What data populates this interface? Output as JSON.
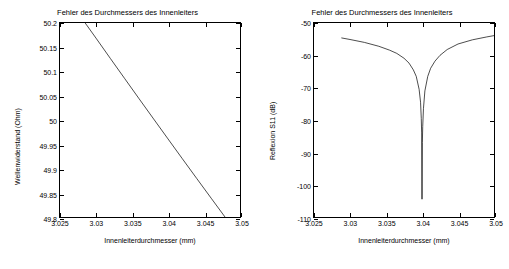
{
  "chart_data": [
    {
      "id": "left",
      "type": "line",
      "title": "Fehler des Durchmessers des Innenleiters",
      "xlabel": "Innenleiterdurchmesser   (mm)",
      "ylabel": "Wellenwiderstand   (Ohm)",
      "xlim": [
        3.025,
        3.05
      ],
      "ylim": [
        49.8,
        50.2
      ],
      "xticks": [
        "3.025",
        "3.03",
        "3.035",
        "3.04",
        "3.045",
        "3.05"
      ],
      "xtick_values": [
        3.025,
        3.03,
        3.035,
        3.04,
        3.045,
        3.05
      ],
      "yticks": [
        "49.8",
        "49.85",
        "49.9",
        "49.95",
        "50",
        "50.05",
        "50.1",
        "50.15",
        "50.2"
      ],
      "ytick_values": [
        49.8,
        49.85,
        49.9,
        49.95,
        50,
        50.05,
        50.1,
        50.15,
        50.2
      ],
      "grid": false,
      "legend": "none",
      "series": [
        {
          "name": "Wellenwiderstand",
          "x": [
            3.0285,
            3.03,
            3.032,
            3.034,
            3.036,
            3.038,
            3.04,
            3.042,
            3.044,
            3.046,
            3.048,
            3.05
          ],
          "y": [
            50.2,
            50.1688,
            50.1268,
            50.0851,
            50.0435,
            50.0022,
            49.961,
            49.92,
            49.8792,
            49.8387,
            49.7983,
            49.7811
          ]
        }
      ]
    },
    {
      "id": "right",
      "type": "line",
      "title": "Fehler des Durchmessers des Innenleiters",
      "xlabel": "Innenleiterdurchmesser   (mm)",
      "ylabel": "Reflexion S11   (dB)",
      "xlim": [
        3.025,
        3.05
      ],
      "ylim": [
        -110,
        -50
      ],
      "xticks": [
        "3.025",
        "3.03",
        "3.035",
        "3.04",
        "3.045",
        "3.05"
      ],
      "xtick_values": [
        3.025,
        3.03,
        3.035,
        3.04,
        3.045,
        3.05
      ],
      "yticks": [
        "-50",
        "-60",
        "-70",
        "-80",
        "-90",
        "-100",
        "-110"
      ],
      "ytick_values": [
        -50,
        -60,
        -70,
        -80,
        -90,
        -100,
        -110
      ],
      "grid": false,
      "legend": "none",
      "series": [
        {
          "name": "Reflexion S11",
          "x": [
            3.0288,
            3.03,
            3.032,
            3.034,
            3.0355,
            3.0365,
            3.0375,
            3.0382,
            3.0388,
            3.0392,
            3.0396,
            3.0398,
            3.0399,
            3.03995,
            3.04,
            3.04005,
            3.0401,
            3.0402,
            3.0404,
            3.0408,
            3.0412,
            3.0418,
            3.0425,
            3.0435,
            3.045,
            3.047,
            3.049,
            3.05
          ],
          "y": [
            -54.6,
            -55.1,
            -56.0,
            -57.2,
            -58.4,
            -59.4,
            -60.9,
            -62.4,
            -64.5,
            -66.5,
            -70.5,
            -74.5,
            -79.5,
            -84.0,
            -104.5,
            -87.0,
            -82.0,
            -76.5,
            -71.0,
            -66.5,
            -64.0,
            -61.8,
            -60.0,
            -58.2,
            -56.5,
            -55.2,
            -54.3,
            -53.9
          ]
        }
      ]
    }
  ]
}
